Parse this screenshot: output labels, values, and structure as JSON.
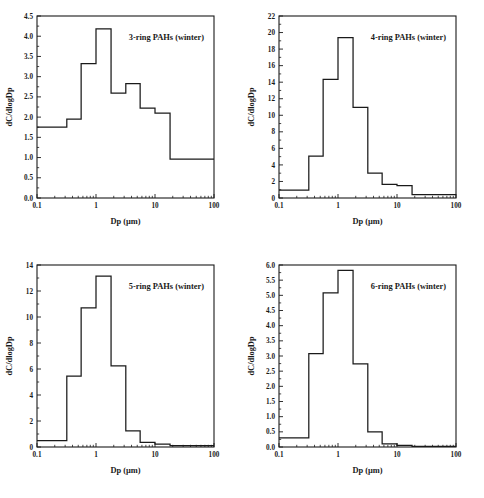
{
  "figure": {
    "title": "",
    "panel_count": 4
  },
  "chart_data": [
    {
      "type": "bar",
      "id": "panel-3ring",
      "title": "3-ring PAHs (winter)",
      "xlabel": "Dp (µm)",
      "ylabel": "dC/dlogDp",
      "xscale": "log",
      "xlim": [
        0.1,
        100
      ],
      "ylim": [
        0.0,
        4.5
      ],
      "xticks": [
        0.1,
        1,
        10,
        100
      ],
      "xticklabels": [
        "0.1",
        "1",
        "10",
        "100"
      ],
      "yticks": [
        0.0,
        0.5,
        1.0,
        1.5,
        2.0,
        2.5,
        3.0,
        3.5,
        4.0,
        4.5
      ],
      "yticklabels": [
        "0.0",
        "0.5",
        "1.0",
        "1.5",
        "2.0",
        "2.5",
        "3.0",
        "3.5",
        "4.0",
        "4.5"
      ],
      "bin_edges": [
        0.1,
        0.32,
        0.56,
        1.0,
        1.8,
        3.2,
        5.6,
        10,
        18,
        100
      ],
      "values": [
        1.75,
        1.95,
        3.32,
        4.18,
        2.59,
        2.83,
        2.22,
        2.1,
        0.96
      ],
      "grid": false,
      "legend_position": "upper right"
    },
    {
      "type": "bar",
      "id": "panel-4ring",
      "title": "4-ring PAHs (winter)",
      "xlabel": "Dp (µm)",
      "ylabel": "dC/dlogDp",
      "xscale": "log",
      "xlim": [
        0.1,
        100
      ],
      "ylim": [
        0,
        22
      ],
      "xticks": [
        0.1,
        1,
        10,
        100
      ],
      "xticklabels": [
        "0.1",
        "1",
        "10",
        "100"
      ],
      "yticks": [
        0,
        2,
        4,
        6,
        8,
        10,
        12,
        14,
        16,
        18,
        20,
        22
      ],
      "yticklabels": [
        "0",
        "2",
        "4",
        "6",
        "8",
        "10",
        "12",
        "14",
        "16",
        "18",
        "20",
        "22"
      ],
      "bin_edges": [
        0.1,
        0.32,
        0.56,
        1.0,
        1.8,
        3.2,
        5.6,
        10,
        18,
        100
      ],
      "values": [
        0.95,
        5.05,
        14.35,
        19.4,
        10.95,
        3.0,
        1.65,
        1.5,
        0.4
      ],
      "grid": false,
      "legend_position": "upper right"
    },
    {
      "type": "bar",
      "id": "panel-5ring",
      "title": "5-ring PAHs (winter)",
      "xlabel": "Dp (µm)",
      "ylabel": "dC/dlogDp",
      "xscale": "log",
      "xlim": [
        0.1,
        100
      ],
      "ylim": [
        0,
        14
      ],
      "xticks": [
        0.1,
        1,
        10,
        100
      ],
      "xticklabels": [
        "0.1",
        "1",
        "10",
        "100"
      ],
      "yticks": [
        0,
        2,
        4,
        6,
        8,
        10,
        12,
        14
      ],
      "yticklabels": [
        "0",
        "2",
        "4",
        "6",
        "8",
        "10",
        "12",
        "14"
      ],
      "bin_edges": [
        0.1,
        0.32,
        0.56,
        1.0,
        1.8,
        3.2,
        5.6,
        10,
        18,
        100
      ],
      "values": [
        0.5,
        5.45,
        10.7,
        13.15,
        6.25,
        1.25,
        0.35,
        0.22,
        0.1
      ],
      "grid": false,
      "legend_position": "upper right"
    },
    {
      "type": "bar",
      "id": "panel-6ring",
      "title": "6-ring PAHs (winter)",
      "xlabel": "Dp (µm)",
      "ylabel": "dC/dlogDp",
      "xscale": "log",
      "xlim": [
        0.1,
        100
      ],
      "ylim": [
        0.0,
        6.0
      ],
      "xticks": [
        0.1,
        1,
        10,
        100
      ],
      "xticklabels": [
        "0.1",
        "1",
        "10",
        "100"
      ],
      "yticks": [
        0.0,
        0.5,
        1.0,
        1.5,
        2.0,
        2.5,
        3.0,
        3.5,
        4.0,
        4.5,
        5.0,
        5.5,
        6.0
      ],
      "yticklabels": [
        "0.0",
        "0.5",
        "1.0",
        "1.5",
        "2.0",
        "2.5",
        "3.0",
        "3.5",
        "4.0",
        "4.5",
        "5.0",
        "5.5",
        "6.0"
      ],
      "bin_edges": [
        0.1,
        0.32,
        0.56,
        1.0,
        1.8,
        3.2,
        5.6,
        10,
        18,
        100
      ],
      "values": [
        0.3,
        3.08,
        5.08,
        5.82,
        2.74,
        0.5,
        0.1,
        0.05,
        0.02
      ],
      "grid": false,
      "legend_position": "upper right"
    }
  ],
  "colors": {
    "line": "#1a1a1a",
    "background": "#ffffff",
    "text": "#1a1a1a"
  }
}
